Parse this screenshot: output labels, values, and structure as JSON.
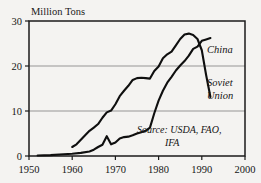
{
  "chart_data": {
    "type": "line",
    "title": "",
    "ylabel": "Million Tons",
    "xlabel": "",
    "xlim": [
      1950,
      2000
    ],
    "ylim": [
      0,
      30
    ],
    "grid": true,
    "gridlines_y": [
      10,
      20
    ],
    "yticks": [
      0,
      10,
      20,
      30
    ],
    "ytick_labels": [
      "0",
      "10",
      "20",
      "30"
    ],
    "xticks": [
      1950,
      1960,
      1970,
      1980,
      1990,
      2000
    ],
    "xtick_labels": [
      "1950",
      "1960",
      "1970",
      "1980",
      "1990",
      "2000"
    ],
    "legend_position": "inline-right",
    "annotations": [
      {
        "text": "Source: USDA, FAO,",
        "line2": "IFA"
      }
    ],
    "series": [
      {
        "name": "China",
        "label": "China",
        "x": [
          1952,
          1955,
          1958,
          1960,
          1962,
          1964,
          1965,
          1966,
          1967,
          1968,
          1969,
          1970,
          1971,
          1972,
          1973,
          1974,
          1975,
          1976,
          1977,
          1978,
          1979,
          1980,
          1981,
          1982,
          1983,
          1984,
          1985,
          1986,
          1987,
          1988,
          1989,
          1990,
          1991,
          1992
        ],
        "values": [
          0.1,
          0.2,
          0.4,
          0.5,
          0.7,
          1.0,
          1.4,
          2.0,
          2.5,
          4.4,
          2.6,
          3.0,
          3.9,
          4.2,
          4.3,
          4.6,
          5.0,
          5.3,
          5.6,
          6.3,
          9.5,
          12.3,
          14.5,
          16.3,
          17.6,
          19.0,
          20.1,
          21.1,
          22.3,
          23.8,
          24.3,
          25.6,
          25.9,
          26.2
        ]
      },
      {
        "name": "Soviet Union",
        "label": "Soviet Union",
        "label_line1": "Soviet",
        "label_line2": "Union",
        "x": [
          1960,
          1961,
          1962,
          1963,
          1964,
          1965,
          1966,
          1967,
          1968,
          1969,
          1970,
          1971,
          1972,
          1973,
          1974,
          1975,
          1976,
          1977,
          1978,
          1979,
          1980,
          1981,
          1982,
          1983,
          1984,
          1985,
          1986,
          1987,
          1988,
          1989,
          1990,
          1991,
          1992
        ],
        "values": [
          2.0,
          2.6,
          3.6,
          4.6,
          5.6,
          6.3,
          7.1,
          8.5,
          9.7,
          10.1,
          11.5,
          13.3,
          14.5,
          15.6,
          16.9,
          17.3,
          17.4,
          17.3,
          17.2,
          18.9,
          19.9,
          21.7,
          22.6,
          23.2,
          24.6,
          26.0,
          27.0,
          27.2,
          26.9,
          26.0,
          23.5,
          18.0,
          13.1
        ]
      }
    ]
  },
  "plot_geometry": {
    "left": 29,
    "right": 245,
    "top": 21,
    "bottom": 156
  }
}
